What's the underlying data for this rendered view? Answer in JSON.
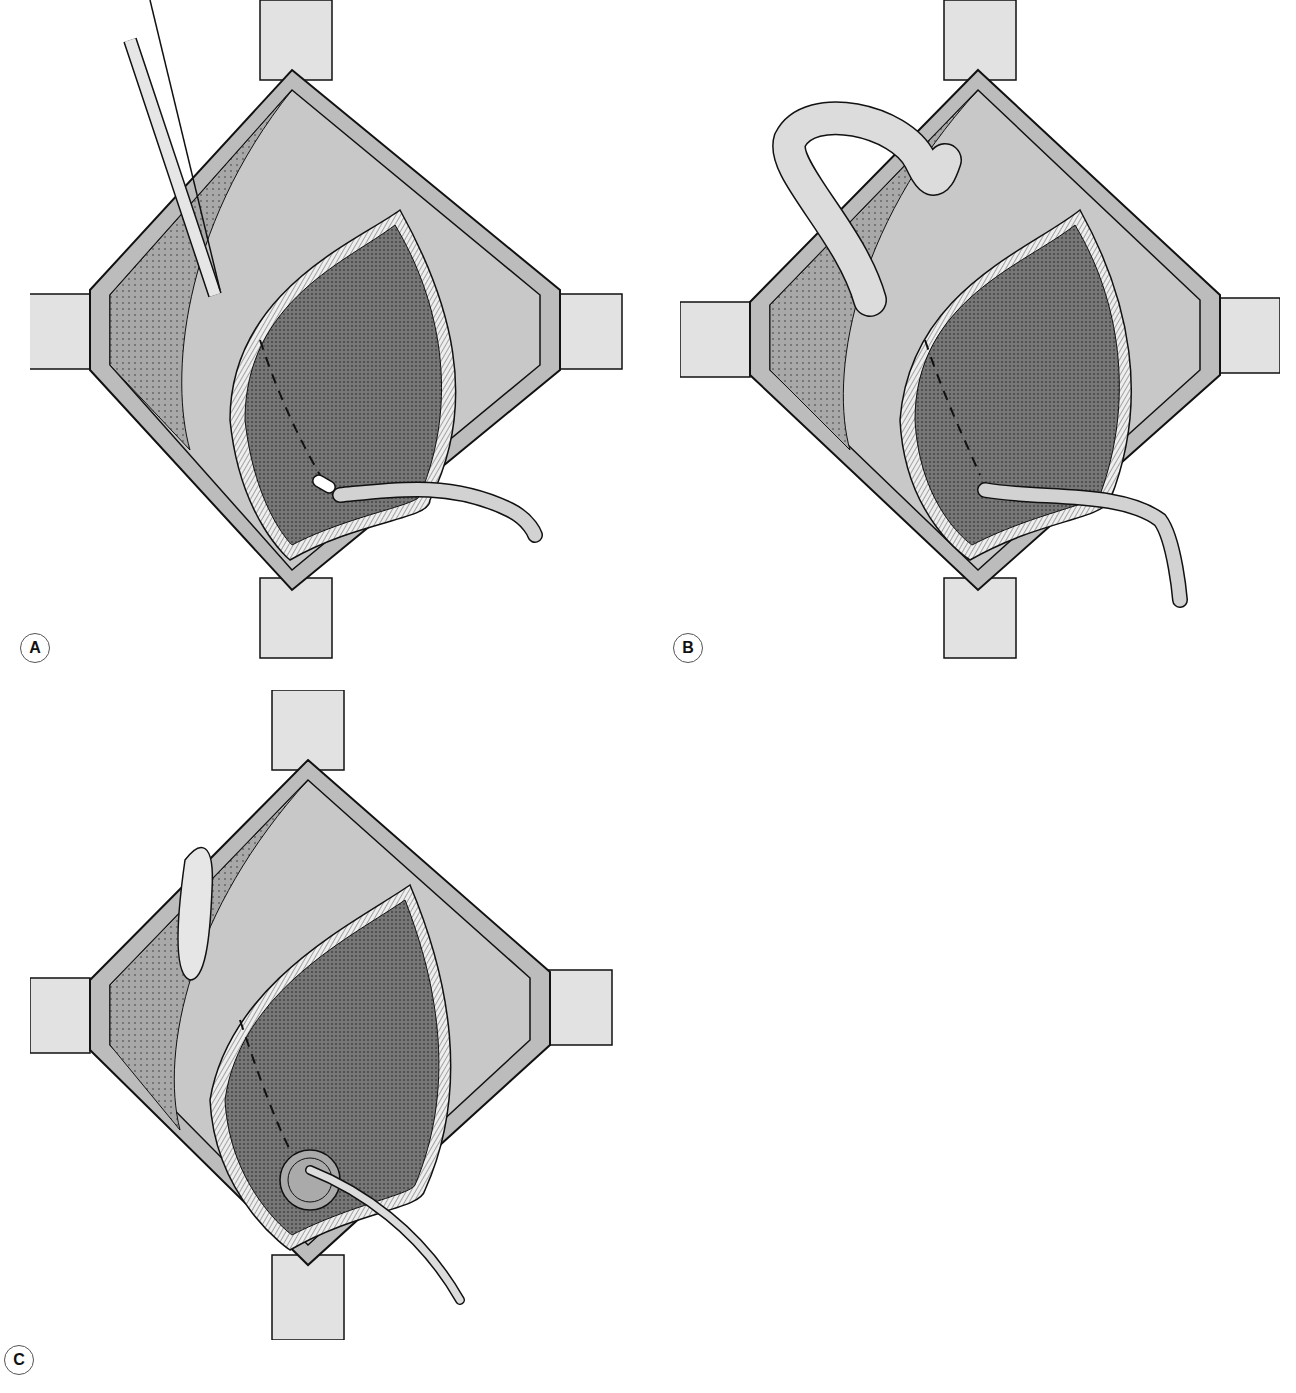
{
  "figure": {
    "panels": [
      {
        "id": "A",
        "label": "A",
        "description": "Suprapubic catheter placed through bladder wall; forceps at upper left; catheter exiting lower right"
      },
      {
        "id": "B",
        "label": "B",
        "description": "Omental/tissue flap looped over retractor; catheter exiting lower right"
      },
      {
        "id": "C",
        "label": "C",
        "description": "Purse-string sutures around catheter entry; tissue tag at upper left"
      }
    ],
    "caption": "",
    "colors": {
      "background": "#ffffff",
      "retractor": "#dedede",
      "fat_tissue": "#9a9a9a",
      "perivesical": "#c4c4c4",
      "bladder_mucosa": "#6e6e6e",
      "bladder_rim": "#e6e6e6",
      "muscle_layer": "#bdbdbd",
      "catheter": "#d2d2d2",
      "outline": "#111111"
    }
  }
}
